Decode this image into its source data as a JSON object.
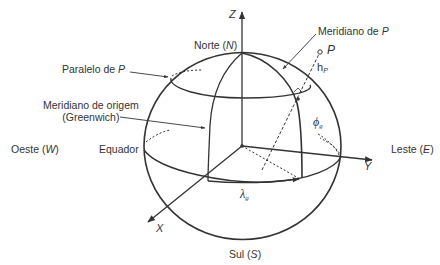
{
  "figure": {
    "colors": {
      "stroke": "#333333",
      "text": "#333333",
      "background": "#ffffff"
    }
  },
  "axes": {
    "z": "Z",
    "y": "Y",
    "x": "X"
  },
  "directions": {
    "north": {
      "word": "Norte",
      "abbr": "N"
    },
    "south": {
      "word": "Sul",
      "abbr": "S"
    },
    "west": {
      "word": "Oeste",
      "abbr": "W"
    },
    "east": {
      "word": "Leste",
      "abbr": "E"
    }
  },
  "labels": {
    "parallel_of_p": {
      "prefix": "Paralelo de ",
      "var": "P"
    },
    "meridian_of_p": {
      "prefix": "Meridiano de ",
      "var": "P"
    },
    "origin_meridian_line1": "Meridiano de origem",
    "origin_meridian_line2": "(Greenwich)",
    "equator": "Equador",
    "point": "P",
    "height": {
      "sym": "h",
      "sub": "P"
    },
    "latitude": {
      "sym": "ϕ",
      "sub": "g"
    },
    "longitude": {
      "sym": "λ",
      "sub": "g"
    }
  }
}
